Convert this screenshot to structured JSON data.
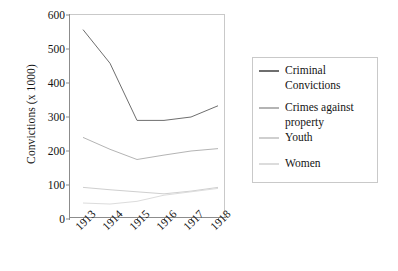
{
  "chart_data": {
    "type": "line",
    "title": "",
    "xlabel": "",
    "ylabel": "Convictions (x 1000)",
    "x": [
      "1913",
      "1914",
      "1915",
      "1916",
      "1917",
      "1918"
    ],
    "xlim": [
      1913,
      1918
    ],
    "ylim": [
      0,
      600
    ],
    "yticks": [
      "0",
      "100",
      "200",
      "300",
      "400",
      "500",
      "600"
    ],
    "ytick_values": [
      0,
      100,
      200,
      300,
      400,
      500,
      600
    ],
    "grid": false,
    "legend_position": "right",
    "series": [
      {
        "name": "Criminal Convictions",
        "color": "#6e6e6e",
        "values": [
          557,
          458,
          290,
          290,
          300,
          333
        ]
      },
      {
        "name": "Crimes against property",
        "color": "#b4b4b4",
        "values": [
          240,
          205,
          175,
          188,
          200,
          207
        ]
      },
      {
        "name": "Youth",
        "color": "#cfcfcf",
        "values": [
          93,
          86,
          80,
          74,
          82,
          93
        ]
      },
      {
        "name": "Women",
        "color": "#dcdcdc",
        "values": [
          47,
          44,
          52,
          70,
          80,
          90
        ]
      }
    ]
  },
  "legend": {
    "entries": [
      {
        "label": "Criminal Convictions"
      },
      {
        "label": "Crimes against property"
      },
      {
        "label": "Youth"
      },
      {
        "label": "Women"
      }
    ]
  }
}
